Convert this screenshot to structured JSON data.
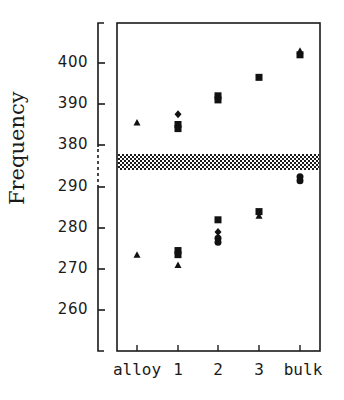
{
  "chart_data": {
    "type": "scatter",
    "title": "",
    "xlabel": "",
    "ylabel": "Frequency",
    "categories": [
      "alloy",
      "1",
      "2",
      "3",
      "bulk"
    ],
    "y_ticks": [
      "400",
      "390",
      "380",
      "290",
      "280",
      "270",
      "260"
    ],
    "y_tick_values_display_order": [
      400,
      390,
      380,
      290,
      280,
      270,
      260
    ],
    "axis_break": {
      "between": [
        "380",
        "290"
      ],
      "style": "dashed",
      "hatched_band": true
    },
    "ylim_upper_segment": [
      375,
      409
    ],
    "ylim_lower_segment": [
      252,
      294
    ],
    "grid": false,
    "legend": null,
    "series": [
      {
        "name": "triangle",
        "marker": "triangle",
        "points": [
          {
            "x": "alloy",
            "y": 385.5
          },
          {
            "x": "alloy",
            "y": 273.5
          },
          {
            "x": "1",
            "y": 271
          },
          {
            "x": "3",
            "y": 283
          },
          {
            "x": "bulk",
            "y": 403
          }
        ]
      },
      {
        "name": "square",
        "marker": "square",
        "points": [
          {
            "x": "1",
            "y": 385
          },
          {
            "x": "1",
            "y": 384
          },
          {
            "x": "1",
            "y": 274.5
          },
          {
            "x": "1",
            "y": 273.5
          },
          {
            "x": "2",
            "y": 392
          },
          {
            "x": "2",
            "y": 391
          },
          {
            "x": "2",
            "y": 282
          },
          {
            "x": "3",
            "y": 396.5
          },
          {
            "x": "3",
            "y": 284
          },
          {
            "x": "bulk",
            "y": 402
          }
        ]
      },
      {
        "name": "diamond",
        "marker": "diamond",
        "points": [
          {
            "x": "1",
            "y": 387.5
          },
          {
            "x": "2",
            "y": 279
          }
        ]
      },
      {
        "name": "circle",
        "marker": "circle",
        "points": [
          {
            "x": "2",
            "y": 277.5
          },
          {
            "x": "2",
            "y": 276.5
          },
          {
            "x": "bulk",
            "y": 292.5
          },
          {
            "x": "bulk",
            "y": 291.5
          }
        ]
      }
    ]
  },
  "labels": {
    "ylabel": "Frequency",
    "x": [
      "alloy",
      "1",
      "2",
      "3",
      "bulk"
    ],
    "y": [
      "400",
      "390",
      "380",
      "290",
      "280",
      "270",
      "260"
    ]
  }
}
